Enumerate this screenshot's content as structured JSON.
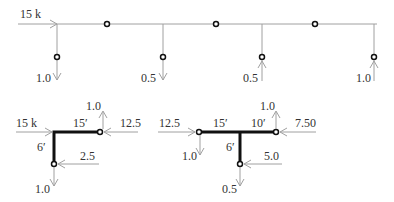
{
  "colors": {
    "thin_line": "#a0a0a0",
    "thick_line": "#111111",
    "node_stroke": "#111111",
    "label": "#333333",
    "background": "#ffffff"
  },
  "top_diagram": {
    "inflow": {
      "label": "15 k",
      "direction": "right"
    },
    "branches": [
      {
        "label": "1.0",
        "direction": "down"
      },
      {
        "label": "0.5",
        "direction": "down"
      },
      {
        "label": "0.5",
        "direction": "up"
      },
      {
        "label": "1.0",
        "direction": "up"
      }
    ],
    "main_line_nodes": 3
  },
  "bottom_left_diagram": {
    "inflow": {
      "label": "15 k",
      "direction": "right"
    },
    "horizontal_length": "15′",
    "vertical_length": "6′",
    "end_node_top": {
      "flow_label": "1.0",
      "flow_direction": "up",
      "side_flow_label": "12.5",
      "side_flow_direction": "left"
    },
    "end_node_bottom": {
      "flow_label": "1.0",
      "flow_direction": "down",
      "side_flow_label": "2.5",
      "side_flow_direction": "left"
    }
  },
  "bottom_right_diagram": {
    "inflow": {
      "label": "12.5",
      "direction": "right"
    },
    "left_node": {
      "flow_label": "1.0",
      "flow_direction": "down"
    },
    "left_segment_length": "15′",
    "right_segment_length": "10′",
    "vertical_length": "6′",
    "right_node": {
      "flow_label": "1.0",
      "flow_direction": "up",
      "side_flow_label": "7.50",
      "side_flow_direction": "left"
    },
    "bottom_node": {
      "flow_label": "0.5",
      "flow_direction": "down",
      "side_flow_label": "5.0",
      "side_flow_direction": "left"
    }
  }
}
